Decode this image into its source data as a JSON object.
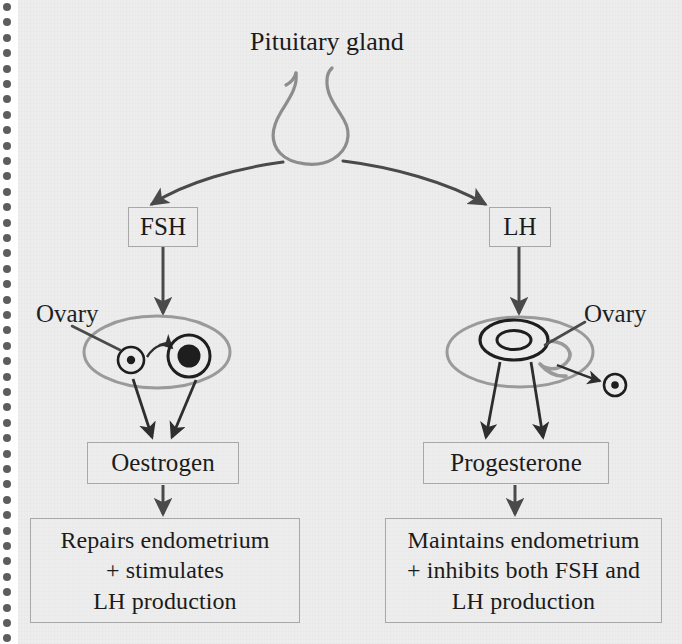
{
  "page": {
    "background_color": "#ededed",
    "paper_color": "#ffffff",
    "ink_color": "#3a3a3a",
    "box_border_color": "#a8a8a8",
    "binding_dot_color": "#5d5d5d",
    "binding_dot_count": 42
  },
  "diagram": {
    "type": "flowchart",
    "source_node": {
      "label": "Pituitary gland",
      "shape": "gland-flask"
    },
    "hormones": [
      {
        "id": "fsh",
        "label": "FSH",
        "side": "left"
      },
      {
        "id": "lh",
        "label": "LH",
        "side": "right"
      }
    ],
    "ovaries": [
      {
        "id": "ovary-left",
        "label": "Ovary",
        "side": "left",
        "contents": "immature follicle developing into mature follicle"
      },
      {
        "id": "ovary-right",
        "label": "Ovary",
        "side": "right",
        "contents": "corpus luteum and released egg"
      }
    ],
    "steroids": [
      {
        "id": "oestrogen",
        "label": "Oestrogen",
        "side": "left"
      },
      {
        "id": "progesterone",
        "label": "Progesterone",
        "side": "right"
      }
    ],
    "effects": [
      {
        "id": "effect-oestrogen",
        "side": "left",
        "lines": [
          "Repairs endometrium",
          "+ stimulates",
          "LH production"
        ]
      },
      {
        "id": "effect-progesterone",
        "side": "right",
        "lines": [
          "Maintains endometrium",
          "+ inhibits both FSH and",
          "LH production"
        ]
      }
    ]
  }
}
